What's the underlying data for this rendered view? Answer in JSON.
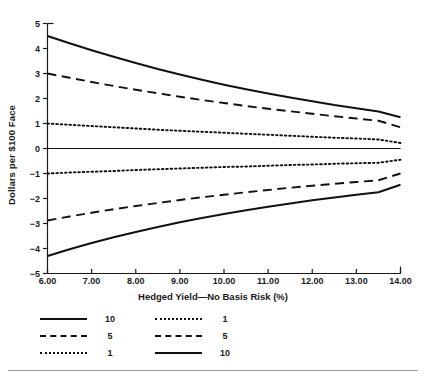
{
  "chart_data": {
    "type": "line",
    "title": "",
    "xlabel": "Hedged Yield—No Basis Risk (%)",
    "ylabel": "Dollars per $100 Face",
    "xlim": [
      6.0,
      14.0
    ],
    "ylim": [
      -5,
      5
    ],
    "xticks": [
      6.0,
      7.0,
      8.0,
      9.0,
      10.0,
      11.0,
      12.0,
      13.0,
      14.0
    ],
    "xtick_labels": [
      "6.00",
      "7.00",
      "8.00",
      "9.00",
      "10.00",
      "11.00",
      "12.00",
      "13.00",
      "14.00"
    ],
    "yticks": [
      -5,
      -4,
      -3,
      -2,
      -1,
      0,
      1,
      2,
      3,
      4,
      5
    ],
    "ytick_labels": [
      "−5",
      "−4",
      "−3",
      "−2",
      "−1",
      "0",
      "1",
      "2",
      "3",
      "4",
      "5"
    ],
    "grid": false,
    "zero_line": true,
    "legend_position": "below-axes",
    "legend_columns": 2,
    "x": [
      6.0,
      6.5,
      7.0,
      7.5,
      8.0,
      8.5,
      9.0,
      9.5,
      10.0,
      10.5,
      11.0,
      11.5,
      12.0,
      12.5,
      13.0,
      13.5,
      14.0
    ],
    "series": [
      {
        "name": "10",
        "label": "10",
        "style": "solid",
        "column": "left",
        "values": [
          4.5,
          4.21,
          3.93,
          3.67,
          3.42,
          3.18,
          2.96,
          2.75,
          2.55,
          2.37,
          2.2,
          2.04,
          1.89,
          1.74,
          1.61,
          1.48,
          1.25
        ]
      },
      {
        "name": "5",
        "label": "5",
        "style": "dashed",
        "column": "left",
        "values": [
          3.0,
          2.83,
          2.66,
          2.5,
          2.35,
          2.21,
          2.07,
          1.94,
          1.82,
          1.7,
          1.59,
          1.49,
          1.39,
          1.29,
          1.2,
          1.11,
          0.85
        ]
      },
      {
        "name": "1",
        "label": "1",
        "style": "dotted",
        "column": "left",
        "values": [
          1.0,
          0.95,
          0.9,
          0.85,
          0.8,
          0.75,
          0.71,
          0.67,
          0.63,
          0.59,
          0.55,
          0.51,
          0.47,
          0.43,
          0.4,
          0.36,
          0.22
        ]
      },
      {
        "name": "1-short",
        "label": "1",
        "style": "dotted",
        "column": "right",
        "values": [
          -1.0,
          -0.96,
          -0.93,
          -0.9,
          -0.86,
          -0.83,
          -0.8,
          -0.77,
          -0.74,
          -0.72,
          -0.69,
          -0.66,
          -0.64,
          -0.61,
          -0.59,
          -0.57,
          -0.45
        ]
      },
      {
        "name": "5-short",
        "label": "5",
        "style": "dashed",
        "column": "right",
        "values": [
          -2.88,
          -2.72,
          -2.57,
          -2.43,
          -2.3,
          -2.18,
          -2.06,
          -1.95,
          -1.85,
          -1.75,
          -1.66,
          -1.57,
          -1.49,
          -1.41,
          -1.34,
          -1.27,
          -1.0
        ]
      },
      {
        "name": "10-short",
        "label": "10",
        "style": "solid",
        "column": "right",
        "values": [
          -4.3,
          -4.03,
          -3.78,
          -3.55,
          -3.34,
          -3.14,
          -2.95,
          -2.78,
          -2.62,
          -2.47,
          -2.33,
          -2.2,
          -2.07,
          -1.96,
          -1.85,
          -1.75,
          -1.45
        ]
      }
    ],
    "legend": {
      "left_column": [
        {
          "label": "10",
          "style": "solid"
        },
        {
          "label": "5",
          "style": "dashed"
        },
        {
          "label": "1",
          "style": "dotted"
        }
      ],
      "right_column": [
        {
          "label": "1",
          "style": "dotted"
        },
        {
          "label": "5",
          "style": "dashed"
        },
        {
          "label": "10",
          "style": "solid"
        }
      ]
    },
    "colors": {
      "line": "#111111",
      "axis": "#1a1a1a",
      "background": "#ffffff",
      "rule": "#9a9a9a"
    }
  }
}
